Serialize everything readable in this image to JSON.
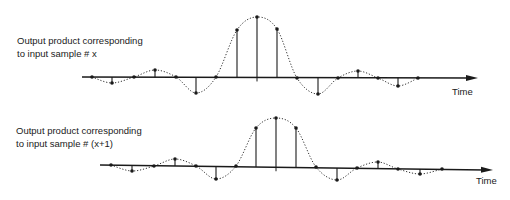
{
  "plots": [
    {
      "id": "sample-x",
      "label_line1": "Output product corresponding",
      "label_line2": "to input sample # x",
      "label_pos": [
        17,
        35
      ],
      "axis_label": "Time",
      "axis_label_pos": [
        452,
        86
      ],
      "axis": {
        "x1": 82,
        "y1": 77,
        "x2": 478,
        "y2": 78
      },
      "samples": [
        {
          "x": 92,
          "y": 77
        },
        {
          "x": 112,
          "y": 83
        },
        {
          "x": 134,
          "y": 77
        },
        {
          "x": 155,
          "y": 70
        },
        {
          "x": 176,
          "y": 77
        },
        {
          "x": 196,
          "y": 93
        },
        {
          "x": 216,
          "y": 77
        },
        {
          "x": 237,
          "y": 30
        },
        {
          "x": 257,
          "y": 17
        },
        {
          "x": 277,
          "y": 29
        },
        {
          "x": 297,
          "y": 78
        },
        {
          "x": 318,
          "y": 94
        },
        {
          "x": 338,
          "y": 78
        },
        {
          "x": 358,
          "y": 71
        },
        {
          "x": 378,
          "y": 78
        },
        {
          "x": 398,
          "y": 86
        },
        {
          "x": 418,
          "y": 78
        }
      ],
      "zero_ticks": [
        257
      ]
    },
    {
      "id": "sample-x-plus-1",
      "label_line1": "Output product corresponding",
      "label_line2": "to input sample # (x+1)",
      "label_pos": [
        16,
        125
      ],
      "axis_label": "Time",
      "axis_label_pos": [
        476,
        175
      ],
      "axis": {
        "x1": 100,
        "y1": 165,
        "x2": 493,
        "y2": 170
      },
      "samples": [
        {
          "x": 111,
          "y": 165
        },
        {
          "x": 132,
          "y": 171
        },
        {
          "x": 154,
          "y": 166
        },
        {
          "x": 175,
          "y": 159
        },
        {
          "x": 196,
          "y": 166
        },
        {
          "x": 216,
          "y": 179
        },
        {
          "x": 236,
          "y": 166
        },
        {
          "x": 256,
          "y": 128
        },
        {
          "x": 276,
          "y": 118
        },
        {
          "x": 296,
          "y": 128
        },
        {
          "x": 316,
          "y": 167
        },
        {
          "x": 337,
          "y": 180
        },
        {
          "x": 357,
          "y": 168
        },
        {
          "x": 378,
          "y": 162
        },
        {
          "x": 398,
          "y": 169
        },
        {
          "x": 420,
          "y": 174
        },
        {
          "x": 442,
          "y": 169
        }
      ],
      "zero_ticks": [
        276
      ]
    }
  ],
  "colors": {
    "ink": "#1a1a1a",
    "dotted": "#333333"
  }
}
